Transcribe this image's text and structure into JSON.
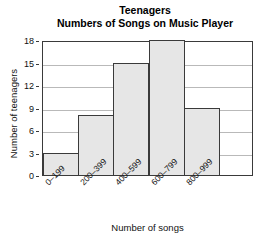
{
  "chart_data": {
    "type": "bar",
    "title": "Teenagers",
    "subtitle": "Numbers of Songs on Music Player",
    "categories": [
      "0–199",
      "200–399",
      "400–599",
      "600–799",
      "800–999"
    ],
    "values": [
      3,
      8,
      15,
      18,
      9
    ],
    "xlabel": "Number of songs",
    "ylabel": "Number of teenagers",
    "ylim": [
      0,
      18
    ],
    "ytick_values": [
      0,
      3,
      6,
      9,
      12,
      15,
      18
    ],
    "ytick_labels": [
      "0",
      "3",
      "6",
      "9",
      "12",
      "15",
      "18"
    ],
    "grid": true,
    "legend": false,
    "bar_fill_color": "#e6e6e6",
    "bar_edge_color": "#3a3a3a",
    "gridline_color": "#b9b9b9",
    "background_color": "#ffffff",
    "histogram_style": true,
    "note": "Histogram-style adjacent bars; plot frame extends past the last bar leaving an empty slot at the right."
  }
}
